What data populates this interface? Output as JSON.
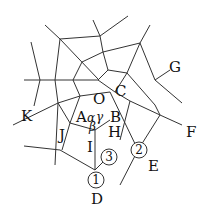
{
  "diagram": {
    "type": "geometric-web",
    "stroke_color": "#333333",
    "background": "#ffffff",
    "labels": {
      "O": "O",
      "A": "A",
      "B": "B",
      "C": "C",
      "D": "D",
      "E": "E",
      "F": "F",
      "G": "G",
      "H": "H",
      "I": "I",
      "J": "J",
      "K": "K",
      "alpha": "α",
      "beta": "β",
      "gamma": "γ"
    },
    "markers": [
      {
        "id": "m1",
        "text": "1"
      },
      {
        "id": "m2",
        "text": "2"
      },
      {
        "id": "m3",
        "text": "3"
      }
    ]
  }
}
